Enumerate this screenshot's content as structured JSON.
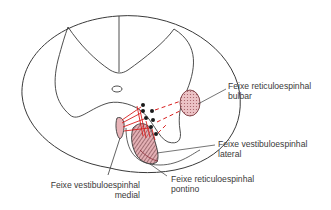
{
  "diagram": {
    "type": "spinal-cord-cross-section",
    "colors": {
      "outline": "#3a3a3a",
      "tract_fill": "#e8b4b8",
      "fiber": "#d81e1e",
      "neuron_dot": "#1a1a1a"
    },
    "labels": {
      "reticulo_bulbar": {
        "line1": "Feixe reticuloespinhal",
        "line2": "bulbar"
      },
      "vestibulo_lateral": {
        "line1": "Feixe vestibuloespinhal",
        "line2": "lateral"
      },
      "reticulo_pontino": {
        "line1": "Feixe reticuloespinhal",
        "line2": "pontino"
      },
      "vestibulo_medial": {
        "line1": "Feixe vestibuloespinhal",
        "line2": "medial"
      }
    }
  }
}
